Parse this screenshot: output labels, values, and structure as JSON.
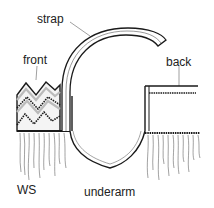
{
  "diagram": {
    "labels": {
      "strap": "strap",
      "front": "front",
      "back": "back",
      "ws": "WS",
      "underarm": "underarm"
    },
    "colors": {
      "ink": "#1a1a1a",
      "background": "#ffffff",
      "pattern_shade": "#cfcfcf"
    },
    "parts": [
      "strap",
      "front",
      "back",
      "underarm",
      "wrong-side"
    ]
  }
}
